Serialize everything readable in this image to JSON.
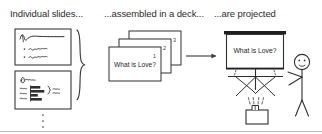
{
  "figure": {
    "background_color": "#ffffff",
    "ink_color": "#333333",
    "text_color": "#1c1c1c"
  },
  "headings": {
    "left": "Individual slides...",
    "middle": "...assembled in a deck...",
    "right": "...are projected"
  },
  "panel_left": {
    "name": "individual-slides",
    "slide_1": {
      "label": "slide-thumbnail-1",
      "content_hint": "squiggle title with two bulleted squiggle lines"
    },
    "slide_2": {
      "label": "slide-thumbnail-2",
      "content_hint": "squiggle title with small horizontal bar chart, axis labels and a brace annotation"
    },
    "ellipsis": "⋮",
    "brace": "}"
  },
  "panel_middle": {
    "name": "slide-deck-stack",
    "slides": [
      {
        "number": "3",
        "title": ""
      },
      {
        "number": "2",
        "title": ""
      },
      {
        "number": "1",
        "title": "What is Love?"
      }
    ]
  },
  "arrow": {
    "name": "flow-arrow",
    "direction": "right"
  },
  "panel_right": {
    "name": "projection-scene",
    "screen": {
      "label": "projection-screen",
      "text": "What is Love?"
    },
    "tripod": {
      "label": "tripod-stand"
    },
    "projector": {
      "label": "projector"
    },
    "light_beams": {
      "label": "light-beams",
      "count": 4
    },
    "person": {
      "label": "stick-figure-presenter"
    }
  },
  "footer_rule": {
    "name": "bottom-divider"
  }
}
